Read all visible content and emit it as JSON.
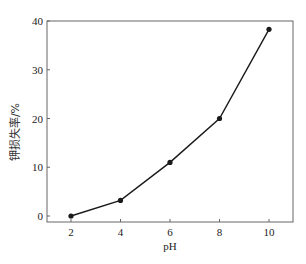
{
  "chart_data": {
    "type": "line",
    "title": "",
    "xlabel": "pH",
    "ylabel": "钾损失率/%",
    "x": [
      2,
      4,
      6,
      8,
      10
    ],
    "series": [
      {
        "name": "钾损失率",
        "values": [
          0,
          3.2,
          11,
          20,
          38.3
        ],
        "marker": "circle",
        "color": "#1a1a1a"
      }
    ],
    "xticks": [
      2,
      4,
      6,
      8,
      10
    ],
    "yticks": [
      0,
      10,
      20,
      30,
      40
    ],
    "xlim": [
      1,
      11
    ],
    "ylim": [
      -1,
      40
    ],
    "grid": false,
    "legend": null
  }
}
